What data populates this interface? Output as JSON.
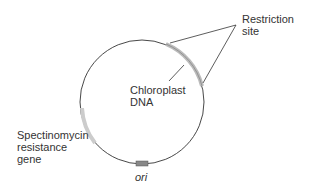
{
  "diagram": {
    "type": "plasmid-map",
    "labels": {
      "restriction_site": "Restriction\nsite",
      "chloroplast_dna": "Chloroplast\nDNA",
      "spectinomycin": "Spectinomycin\nresistance\ngene",
      "ori": "ori"
    },
    "colors": {
      "line": "#333333",
      "gene": "#bbbbbb",
      "ori": "#777777"
    }
  }
}
